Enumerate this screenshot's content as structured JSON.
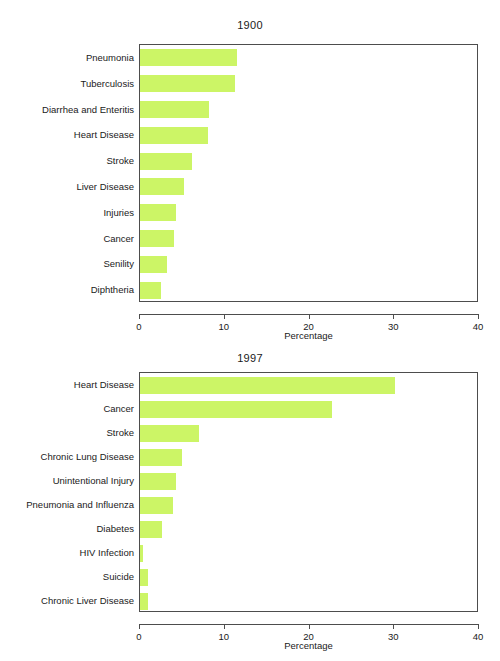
{
  "page": {
    "background_color": "#ffffff",
    "bar_color": "#ccf566",
    "axis_color": "#4d4d4d",
    "text_color": "#1a1a1a"
  },
  "chart_data": [
    {
      "type": "bar",
      "orientation": "horizontal",
      "title": "1900",
      "xlabel": "Percentage",
      "ylabel": "",
      "xlim": [
        0,
        40
      ],
      "xticks": [
        0,
        10,
        20,
        30,
        40
      ],
      "xticklabels": [
        "0",
        "10",
        "20",
        "30",
        "40"
      ],
      "grid": false,
      "legend": false,
      "bar_color": "#ccf566",
      "categories": [
        "Pneumonia",
        "Tuberculosis",
        "Diarrhea and Enteritis",
        "Heart Disease",
        "Stroke",
        "Liver Disease",
        "Injuries",
        "Cancer",
        "Senility",
        "Diphtheria"
      ],
      "values": [
        11.5,
        11.2,
        8.2,
        8.0,
        6.1,
        5.2,
        4.3,
        4.0,
        3.2,
        2.5
      ]
    },
    {
      "type": "bar",
      "orientation": "horizontal",
      "title": "1997",
      "xlabel": "Percentage",
      "ylabel": "",
      "xlim": [
        0,
        40
      ],
      "xticks": [
        0,
        10,
        20,
        30,
        40
      ],
      "xticklabels": [
        "0",
        "10",
        "20",
        "30",
        "40"
      ],
      "grid": false,
      "legend": false,
      "bar_color": "#ccf566",
      "categories": [
        "Heart Disease",
        "Cancer",
        "Stroke",
        "Chronic Lung Disease",
        "Unintentional Injury",
        "Pneumonia and Influenza",
        "Diabetes",
        "HIV Infection",
        "Suicide",
        "Chronic Liver Disease"
      ],
      "values": [
        30.1,
        22.6,
        7.0,
        4.9,
        4.3,
        3.9,
        2.6,
        0.4,
        1.0,
        0.9
      ]
    }
  ]
}
